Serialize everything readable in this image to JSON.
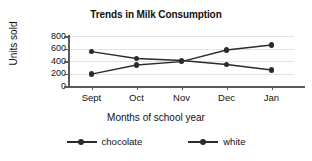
{
  "chart_data": {
    "type": "line",
    "title": "Trends in Milk Consumption",
    "xlabel": "Months of school year",
    "ylabel": "Units sold",
    "categories": [
      "Sept",
      "Oct",
      "Nov",
      "Dec",
      "Jan"
    ],
    "yticks": [
      0,
      200,
      400,
      600,
      800
    ],
    "ylim": [
      0,
      800
    ],
    "grid": true,
    "legend_position": "bottom",
    "series": [
      {
        "name": "chocolate",
        "color": "#2b2b2b",
        "marker": "circle",
        "values": [
          190,
          335,
          390,
          575,
          655
        ]
      },
      {
        "name": "white",
        "color": "#2b2b2b",
        "marker": "circle",
        "values": [
          550,
          440,
          410,
          345,
          255
        ]
      }
    ]
  },
  "legend": {
    "items": [
      {
        "label": "chocolate",
        "marker_name": "legend-marker-chocolate"
      },
      {
        "label": "white",
        "marker_name": "legend-marker-white"
      }
    ]
  }
}
